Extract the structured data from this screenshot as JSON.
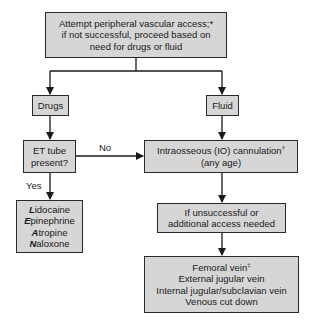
{
  "diagram": {
    "start": {
      "lines": [
        "Attempt peripheral vascular access;*",
        "if not successful, proceed based on",
        "need for drugs or fluid"
      ]
    },
    "drugs": {
      "label": "Drugs"
    },
    "fluid": {
      "label": "Fluid"
    },
    "et_tube": {
      "lines": [
        "ET tube",
        "present?"
      ]
    },
    "io": {
      "line1": "Intraosseous (IO) cannulation",
      "line1_sup": "†",
      "line2": "(any age)"
    },
    "edges": {
      "no": "No",
      "yes": "Yes"
    },
    "leaners": [
      {
        "initial": "L",
        "rest": "idocaine"
      },
      {
        "initial": "E",
        "rest": "pinephrine"
      },
      {
        "initial": "A",
        "rest": "tropine"
      },
      {
        "initial": "N",
        "rest": "aloxone"
      }
    ],
    "unsuccessful": {
      "lines": [
        "If unsuccessful or",
        "additional access needed"
      ]
    },
    "sites": {
      "first": "Femoral vein",
      "first_sup": "‡",
      "others": [
        "External jugular vein",
        "Internal jugular/subclavian vein",
        "Venous cut down"
      ]
    }
  }
}
